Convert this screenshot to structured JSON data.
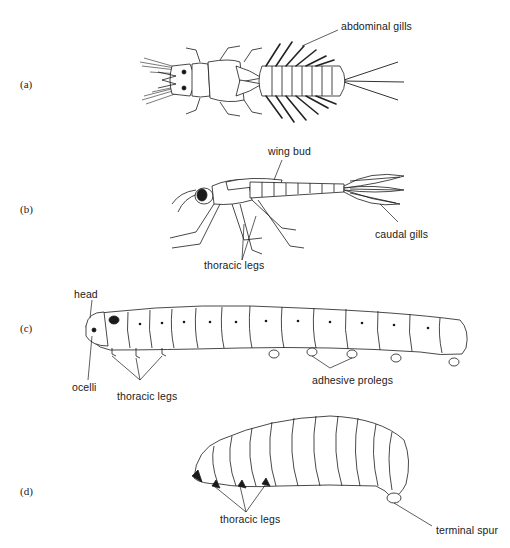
{
  "figure": {
    "panels": [
      {
        "id": "a",
        "label": "(a)",
        "subject": "mayfly-like nymph, dorsal view",
        "callouts": [
          "abdominal gills"
        ]
      },
      {
        "id": "b",
        "label": "(b)",
        "subject": "damselfly-like nymph, lateral view",
        "callouts": [
          "wing bud",
          "caudal gills",
          "thoracic legs"
        ]
      },
      {
        "id": "c",
        "label": "(c)",
        "subject": "caterpillar larva, lateral view",
        "callouts": [
          "head",
          "ocelli",
          "thoracic legs",
          "adhesive prolegs"
        ]
      },
      {
        "id": "d",
        "label": "(d)",
        "subject": "grub larva, lateral view",
        "callouts": [
          "thoracic legs",
          "terminal spur"
        ]
      }
    ]
  },
  "colors": {
    "ink": "#1a1a1a",
    "paper": "#ffffff",
    "shade": "#3a3a3a"
  }
}
